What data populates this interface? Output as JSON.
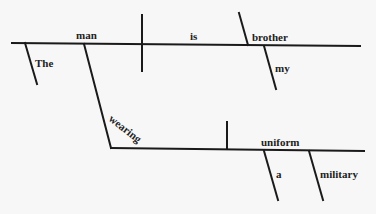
{
  "diagram": {
    "type": "sentence-diagram",
    "words": {
      "subject": "man",
      "verb": "is",
      "predicate_noun": "brother",
      "subject_modifier": "The",
      "predicate_modifier": "my",
      "participle": "wearing",
      "object": "uniform",
      "object_modifier_1": "a",
      "object_modifier_2": "military"
    }
  }
}
